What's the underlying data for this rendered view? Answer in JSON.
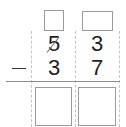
{
  "problem": {
    "operator": "−",
    "top_number": {
      "tens": "5",
      "ones": "3",
      "tens_crossed_out": true
    },
    "bottom_number": {
      "tens": "3",
      "ones": "7"
    },
    "borrow_boxes": {
      "tens": "",
      "ones": ""
    },
    "answer_boxes": {
      "tens": "",
      "ones": ""
    }
  },
  "colors": {
    "digit": "#1e1e1e",
    "box_border": "#9a9a9a",
    "guide_line": "#c4c4c4",
    "result_line": "#8c8c8c"
  }
}
